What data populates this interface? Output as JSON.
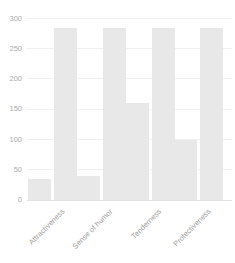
{
  "chart_data": {
    "type": "bar",
    "title": "",
    "xlabel": "",
    "ylabel": "",
    "categories": [
      "Attractiveness",
      "Sense of humor",
      "Tenderness",
      "Protectiveness"
    ],
    "series": [
      {
        "name": "series-1",
        "values": [
          35,
          40,
          160,
          100
        ]
      },
      {
        "name": "series-2",
        "values": [
          285,
          285,
          285,
          285
        ]
      }
    ],
    "ylim": [
      0,
      300
    ],
    "yticks": [
      0,
      50,
      100,
      150,
      200,
      250,
      300
    ],
    "grid": true,
    "legend": "none",
    "bar_color": "#e8e8e8",
    "tick_label_color": "#ababab",
    "category_label_color": "#9c9c9c",
    "background_color": "#ffffff"
  }
}
